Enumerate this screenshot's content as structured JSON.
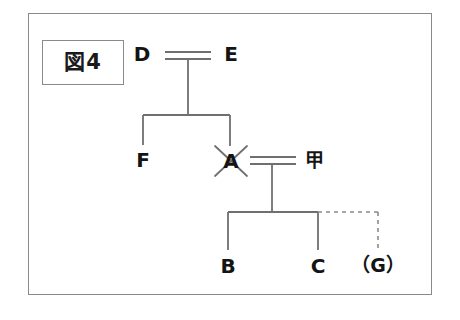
{
  "figure": {
    "label": "図4"
  },
  "colors": {
    "line": "#6f6f6f",
    "text": "#141414",
    "frame": "#8a8a8a",
    "background": "#ffffff"
  },
  "persons": {
    "d": "D",
    "e": "E",
    "f": "F",
    "a": "A",
    "kou": "甲",
    "b": "B",
    "c": "C",
    "g": "（G）"
  },
  "relations": {
    "marriage_top": "D = E",
    "marriage_lower": "A = 甲",
    "children_of_d_e": [
      "F",
      "A"
    ],
    "children_of_a_kou": [
      "B",
      "C",
      "（G）"
    ],
    "deceased_mark_on": "A",
    "dashed_child": "（G）"
  }
}
